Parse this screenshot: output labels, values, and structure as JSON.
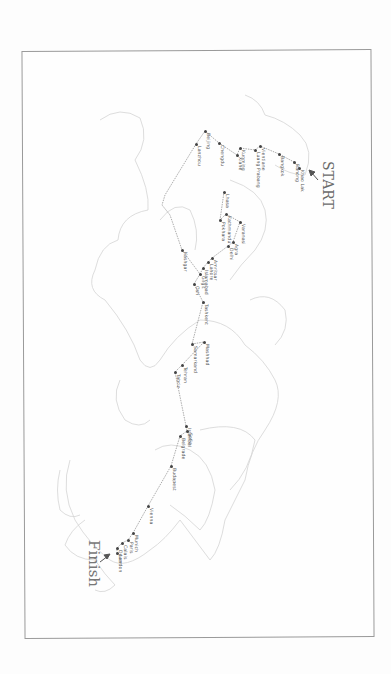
{
  "map": {
    "orientation": "rotated 90deg clockwise",
    "start_label": "START",
    "finish_label": "Finish",
    "frame_color": "#9a9a9a",
    "land_outline_color": "#d0d0d0",
    "route_color": "#8a8a8a",
    "stops": [
      {
        "name": "Khao Lak",
        "x": 299,
        "y": 168
      },
      {
        "name": "Ranong",
        "x": 294,
        "y": 162
      },
      {
        "name": "Bangkok",
        "x": 279,
        "y": 154
      },
      {
        "name": "Vientiane",
        "x": 260,
        "y": 146
      },
      {
        "name": "Luang Prabang",
        "x": 255,
        "y": 150
      },
      {
        "name": "Kunming",
        "x": 240,
        "y": 148
      },
      {
        "name": "Xiahe",
        "x": 237,
        "y": 155
      },
      {
        "name": "Chengdu",
        "x": 219,
        "y": 143
      },
      {
        "name": "Beijing",
        "x": 205,
        "y": 131
      },
      {
        "name": "Lanzhou",
        "x": 196,
        "y": 144
      },
      {
        "name": "Lhasa",
        "x": 224,
        "y": 192
      },
      {
        "name": "Kathmandu",
        "x": 226,
        "y": 214
      },
      {
        "name": "Pokhara",
        "x": 220,
        "y": 220
      },
      {
        "name": "Varanasi",
        "x": 240,
        "y": 222
      },
      {
        "name": "Agra",
        "x": 233,
        "y": 242
      },
      {
        "name": "Delhi",
        "x": 228,
        "y": 246
      },
      {
        "name": "Amritsar",
        "x": 212,
        "y": 258
      },
      {
        "name": "Lahore",
        "x": 208,
        "y": 262
      },
      {
        "name": "Islamabad",
        "x": 203,
        "y": 268
      },
      {
        "name": "Gilgit",
        "x": 200,
        "y": 274
      },
      {
        "name": "Kashgar",
        "x": 182,
        "y": 250
      },
      {
        "name": "Osh",
        "x": 194,
        "y": 284
      },
      {
        "name": "Tashkent",
        "x": 203,
        "y": 302
      },
      {
        "name": "Samarkand",
        "x": 192,
        "y": 344
      },
      {
        "name": "Mashhad",
        "x": 204,
        "y": 342
      },
      {
        "name": "Tehran",
        "x": 182,
        "y": 365
      },
      {
        "name": "Tabriz",
        "x": 175,
        "y": 372
      },
      {
        "name": "Istanbul",
        "x": 186,
        "y": 426
      },
      {
        "name": "Sofia",
        "x": 187,
        "y": 431
      },
      {
        "name": "Belgrade",
        "x": 180,
        "y": 436
      },
      {
        "name": "Budapest",
        "x": 171,
        "y": 466
      },
      {
        "name": "Vienna",
        "x": 148,
        "y": 506
      },
      {
        "name": "Munich",
        "x": 133,
        "y": 533
      },
      {
        "name": "Paris",
        "x": 128,
        "y": 540
      },
      {
        "name": "Calais",
        "x": 122,
        "y": 543
      },
      {
        "name": "Dover",
        "x": 117,
        "y": 548
      },
      {
        "name": "London",
        "x": 117,
        "y": 553
      }
    ],
    "finish_arrow": {
      "x": 108,
      "y": 556
    },
    "start_arrow": {
      "x": 311,
      "y": 172
    }
  }
}
